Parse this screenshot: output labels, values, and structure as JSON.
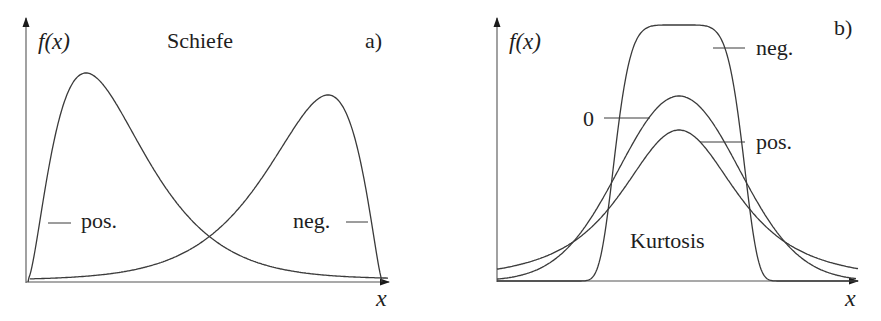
{
  "panels": [
    {
      "id": "a",
      "tag": "a)",
      "title": "Schiefe",
      "y_label": "f(x)",
      "x_label": "x",
      "curves": [
        {
          "label": "pos.",
          "description": "right-skewed (positive skewness)"
        },
        {
          "label": "neg.",
          "description": "left-skewed (negative skewness)"
        }
      ]
    },
    {
      "id": "b",
      "tag": "b)",
      "title": "Kurtosis",
      "y_label": "f(x)",
      "x_label": "x",
      "curves": [
        {
          "label": "neg.",
          "description": "platykurtic, flat-topped (negative excess kurtosis)"
        },
        {
          "label": "0",
          "description": "normal distribution (zero excess kurtosis)"
        },
        {
          "label": "pos.",
          "description": "leptokurtic, heavy-tailed (positive excess kurtosis)"
        }
      ]
    }
  ],
  "geometry": {
    "a": {
      "x0": 26,
      "y0": 282,
      "xend": 389,
      "ytop": 27
    },
    "b": {
      "x0": 497,
      "y0": 281,
      "xend": 858,
      "ytop": 27
    },
    "stroke": "#3a3a3a"
  }
}
